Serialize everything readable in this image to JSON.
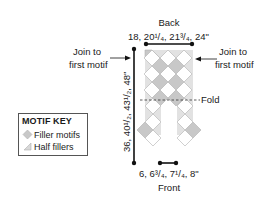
{
  "diagram": {
    "back_label": "Back",
    "back_width": "18, 20¹/₄, 21³/₄, 24\"",
    "front_label": "Front",
    "front_width": "6, 6³/₄, 7¹/₄, 8\"",
    "length": "36, 40¹/₂, 43¹/₂, 48\"",
    "join_left": [
      "Join to",
      "first motif"
    ],
    "join_right": [
      "Join to",
      "first motif"
    ],
    "fold_label": "Fold"
  },
  "key": {
    "title": "MOTIF KEY",
    "items": [
      {
        "icon": "diamond-icon",
        "label": "Filler motifs"
      },
      {
        "icon": "half-triangle-icon",
        "label": "Half fillers"
      }
    ]
  },
  "colors": {
    "filler_gray": "#c8c8c8",
    "half_filler": "#e2e2e2",
    "motif_white": "#ffffff",
    "line": "#111111",
    "outline": "#b0b0b0"
  }
}
